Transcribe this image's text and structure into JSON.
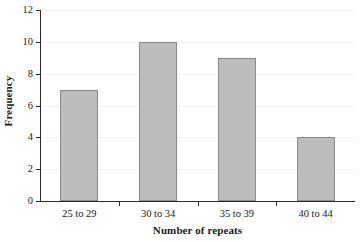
{
  "chart_data": {
    "type": "bar",
    "title": "",
    "subtitle": "",
    "xlabel": "Number of repeats",
    "ylabel": "Frequency",
    "categories": [
      "25 to 29",
      "30 to 34",
      "35 to 39",
      "40 to 44"
    ],
    "values": [
      7,
      10,
      9,
      4
    ],
    "series": [
      {
        "name": "Frequency",
        "values": [
          7,
          10,
          9,
          4
        ]
      }
    ],
    "ylim": [
      0,
      12
    ],
    "ytick_labels": [
      "0",
      "2",
      "4",
      "6",
      "8",
      "10",
      "12"
    ],
    "ytick_values": [
      0,
      2,
      4,
      6,
      8,
      10,
      12
    ],
    "grid": true,
    "grid_axis": "y",
    "legend": false,
    "legend_position": "none",
    "annotations": [],
    "colors": {
      "bar_fill": "#bcbcbc",
      "bar_border": "#8a8a8a",
      "axis": "#2b2b2b",
      "gridline": "#f2f2f4",
      "text": "#1a1a1a",
      "background": "#ffffff"
    }
  }
}
